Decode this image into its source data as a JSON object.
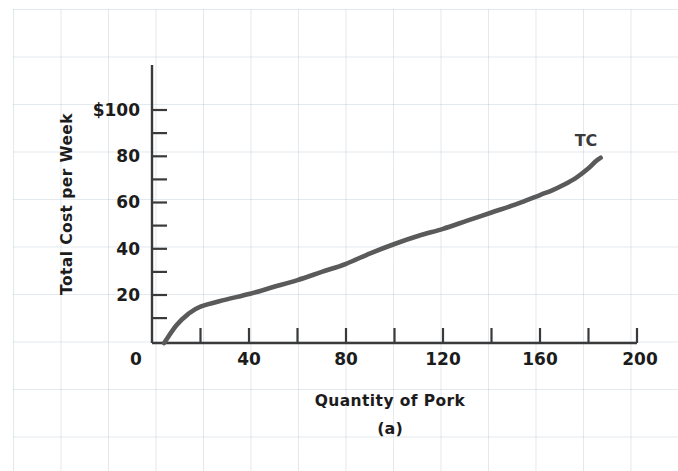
{
  "figure": {
    "panel_label": "(a)",
    "background_color": "#ffffff",
    "grid_color": "#a0b9c8",
    "axis_color": "#3a3a3a",
    "curve_color": "#5a5a5a",
    "text_color": "#1c1c1c"
  },
  "chart_data": {
    "type": "line",
    "title": "",
    "subtitle": "(a)",
    "xlabel": "Quantity of Pork",
    "ylabel": "Total Cost  per Week",
    "xlim": [
      0,
      200
    ],
    "ylim": [
      0,
      110
    ],
    "xticks": [
      0,
      20,
      40,
      60,
      80,
      100,
      120,
      140,
      160,
      180,
      200
    ],
    "xtick_labels": [
      "0",
      "",
      "40",
      "",
      "80",
      "",
      "120",
      "",
      "160",
      "",
      "200"
    ],
    "yticks": [
      10,
      20,
      30,
      40,
      50,
      60,
      70,
      80,
      90,
      100
    ],
    "ytick_labels": [
      "",
      "20",
      "",
      "40",
      "",
      "60",
      "",
      "80",
      "",
      "$100"
    ],
    "grid": true,
    "legend": "none",
    "annotations": [
      {
        "text": "TC",
        "x": 185,
        "y": 88
      }
    ],
    "series": [
      {
        "name": "TC",
        "label": "TC",
        "color": "#5a5a5a",
        "x": [
          5,
          10,
          15,
          20,
          30,
          40,
          50,
          60,
          70,
          80,
          90,
          100,
          110,
          120,
          130,
          140,
          150,
          160,
          165,
          170,
          175,
          180,
          183,
          185
        ],
        "values": [
          0,
          7.5,
          12.5,
          15.6,
          18.5,
          21.0,
          24.0,
          27.0,
          30.5,
          34.0,
          38.5,
          42.5,
          46.0,
          49.0,
          52.5,
          56.0,
          59.5,
          63.5,
          65.5,
          68.0,
          71.0,
          75.0,
          78.0,
          79.5
        ]
      }
    ]
  },
  "axis_labels": {
    "y_axis_title": "Total Cost  per Week",
    "x_axis_title": "Quantity of Pork",
    "y_ticks_shown": [
      "$100",
      "80",
      "60",
      "40",
      "20"
    ],
    "x_ticks_shown": [
      "0",
      "40",
      "80",
      "120",
      "160",
      "200"
    ]
  }
}
